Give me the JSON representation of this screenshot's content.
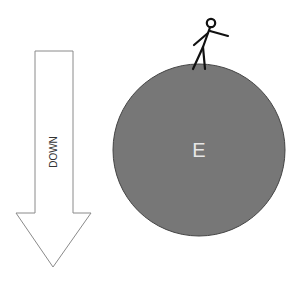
{
  "diagram": {
    "arrow": {
      "label": "DOWN",
      "direction": "down",
      "fill": "#ffffff",
      "stroke": "#8a8a8a"
    },
    "earth": {
      "label": "E",
      "fill": "#777777",
      "stroke": "#444444",
      "label_color": "#e6e6e6"
    },
    "person": {
      "description": "stick figure standing on top of the sphere",
      "stroke": "#111111"
    }
  }
}
